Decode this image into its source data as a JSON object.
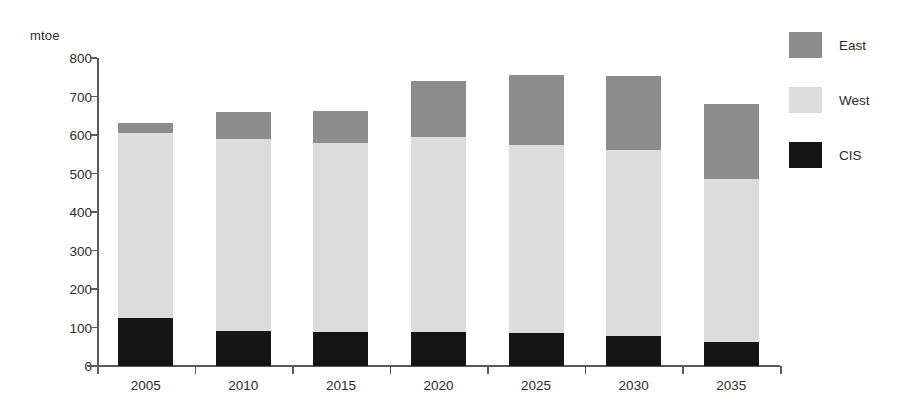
{
  "chart_data": {
    "type": "bar",
    "stacked": true,
    "title": "",
    "xlabel": "",
    "ylabel": "mtoe",
    "unit_label": "mtoe",
    "categories": [
      "2005",
      "2010",
      "2015",
      "2020",
      "2025",
      "2030",
      "2035"
    ],
    "series": [
      {
        "name": "CIS",
        "color": "#151515",
        "values": [
          125,
          90,
          88,
          88,
          85,
          78,
          62
        ]
      },
      {
        "name": "West",
        "color": "#dcdcdc",
        "values": [
          480,
          500,
          490,
          507,
          490,
          482,
          423
        ]
      },
      {
        "name": "East",
        "color": "#8c8c8c",
        "values": [
          25,
          70,
          85,
          145,
          180,
          193,
          195
        ]
      }
    ],
    "stack_order_bottom_to_top": [
      "CIS",
      "West",
      "East"
    ],
    "totals": [
      630,
      660,
      663,
      740,
      755,
      753,
      680
    ],
    "ylim": [
      0,
      800
    ],
    "ytick_values": [
      0,
      100,
      200,
      300,
      400,
      500,
      600,
      700,
      800
    ],
    "ytick_labels": [
      "0",
      "100",
      "200",
      "300",
      "400",
      "500",
      "600",
      "700",
      "800"
    ],
    "grid": false,
    "legend_position": "right-top",
    "legend": [
      {
        "label": "East",
        "color": "#8c8c8c"
      },
      {
        "label": "West",
        "color": "#dcdcdc"
      },
      {
        "label": "CIS",
        "color": "#151515"
      }
    ]
  }
}
